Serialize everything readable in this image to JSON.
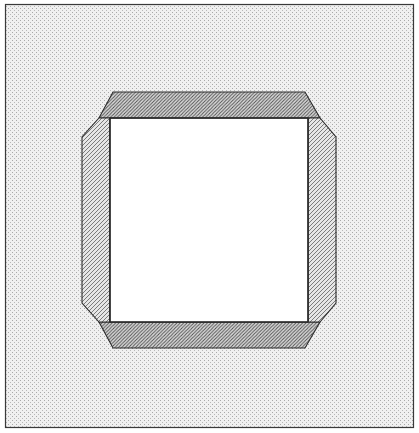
{
  "figure": {
    "title": "Carton Blank With Folded Flaps",
    "canvas": {
      "width": 419,
      "height": 433,
      "background_color": "#ffffff"
    },
    "border": {
      "name": "outer-frame",
      "x": 5,
      "y": 4,
      "width": 409,
      "height": 424,
      "stroke_color": "#3a3a3a",
      "stroke_width": 1.2,
      "fill_color": "#efefef"
    },
    "background_panel": {
      "name": "stippled-background",
      "fill_color": "#eeeeee",
      "stipple_color": "#9a9a9a",
      "stipple_density": "fine"
    },
    "shapes": [
      {
        "id": "top-flap",
        "label": "Top Flap",
        "type": "trapezoid",
        "points": "113,92 305,92 320,118 99,118",
        "fill_color": "#d8d8d8",
        "hatch_color": "#4a4a4a",
        "stroke_color": "#2b2b2b",
        "stroke_width": 1.1,
        "fill_pattern": "dense-diagonal-stipple"
      },
      {
        "id": "left-flap",
        "label": "Left Flap",
        "type": "trapezoid",
        "points": "82,118 110,118 110,322 82,303",
        "fill_color": "#dedede",
        "hatch_color": "#5a5a5a",
        "stroke_color": "#2b2b2b",
        "stroke_width": 1.1,
        "fill_pattern": "diagonal-stipple"
      },
      {
        "id": "right-flap",
        "label": "Right Flap",
        "type": "trapezoid",
        "points": "308,118 336,118 336,303 308,322",
        "fill_color": "#dedede",
        "hatch_color": "#5a5a5a",
        "stroke_color": "#2b2b2b",
        "stroke_width": 1.1,
        "fill_pattern": "diagonal-stipple"
      },
      {
        "id": "bottom-flap",
        "label": "Bottom Flap",
        "type": "trapezoid",
        "points": "99,322 320,322 305,348 113,348",
        "fill_color": "#d4d4d4",
        "hatch_color": "#4a4a4a",
        "stroke_color": "#2b2b2b",
        "stroke_width": 1.1,
        "fill_pattern": "dense-diagonal-stipple"
      },
      {
        "id": "center-panel",
        "label": "Center Panel",
        "type": "rectangle",
        "x": 110,
        "y": 118,
        "width": 198,
        "height": 204,
        "fill_color": "#ffffff",
        "stroke_color": "#2b2b2b",
        "stroke_width": 1.3
      }
    ],
    "fold_lines": [
      {
        "id": "fold-top",
        "label": "Top Fold Line",
        "x1": 110,
        "y1": 118,
        "x2": 308,
        "y2": 118
      },
      {
        "id": "fold-bottom",
        "label": "Bottom Fold Line",
        "x1": 110,
        "y1": 322,
        "x2": 308,
        "y2": 322
      },
      {
        "id": "fold-left",
        "label": "Left Fold Line",
        "x1": 110,
        "y1": 118,
        "x2": 110,
        "y2": 322
      },
      {
        "id": "fold-right",
        "label": "Right Fold Line",
        "x1": 308,
        "y1": 118,
        "x2": 308,
        "y2": 322
      }
    ],
    "colors": {
      "line": "#2b2b2b",
      "frame": "#3a3a3a",
      "background": "#eeeeee",
      "panel": "#ffffff",
      "flap_light": "#dedede",
      "flap_dark": "#d6d6d6"
    }
  }
}
